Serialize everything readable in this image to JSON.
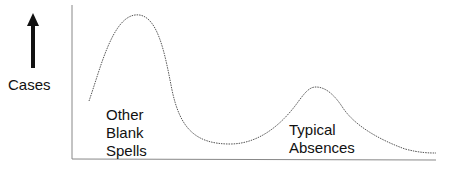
{
  "diagram": {
    "type": "bimodal-distribution-sketch",
    "y_axis_label": "Cases",
    "y_axis_arrow": "up-arrow",
    "peaks": [
      {
        "label_lines": [
          "Other",
          "Blank",
          "Spells"
        ],
        "relative_height": "high",
        "position": "left"
      },
      {
        "label_lines": [
          "Typical",
          "Absences"
        ],
        "relative_height": "medium",
        "position": "right"
      }
    ],
    "colors": {
      "axis": "#888888",
      "curve": "#555555",
      "arrow": "#111111",
      "text": "#111111"
    }
  }
}
